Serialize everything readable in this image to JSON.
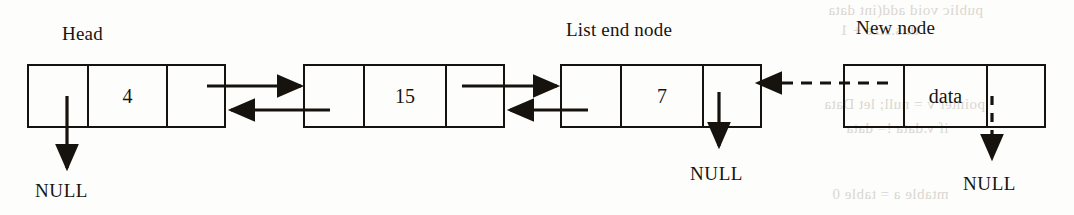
{
  "diagram": {
    "background_color": "#fdfdfb",
    "ink_color": "#16120d",
    "captions": {
      "head": "Head",
      "list_end_node": "List end node",
      "new_node": "New node"
    },
    "null_labels": {
      "head_prev": "NULL",
      "end_next": "NULL",
      "new_next": "NULL"
    },
    "nodes": [
      {
        "name": "head-node",
        "value": "",
        "prev_cell": "",
        "data_cell": "4",
        "next_cell": "",
        "caption": "Head"
      },
      {
        "name": "second-node",
        "value": "",
        "prev_cell": "",
        "data_cell": "15",
        "next_cell": "",
        "caption": ""
      },
      {
        "name": "list-end-node",
        "value": "",
        "prev_cell": "",
        "data_cell": "7",
        "next_cell": "",
        "caption": "List end node"
      },
      {
        "name": "new-node",
        "value": "",
        "prev_cell": "",
        "data_cell": "data",
        "next_cell": "",
        "caption": "New node"
      }
    ],
    "links": [
      {
        "name": "next-link-1",
        "from": "head-node",
        "to": "second-node",
        "direction": "forward",
        "style": "solid"
      },
      {
        "name": "prev-link-1",
        "from": "second-node",
        "to": "head-node",
        "direction": "backward",
        "style": "solid"
      },
      {
        "name": "next-link-2",
        "from": "second-node",
        "to": "list-end-node",
        "direction": "forward",
        "style": "solid"
      },
      {
        "name": "prev-link-2",
        "from": "list-end-node",
        "to": "second-node",
        "direction": "backward",
        "style": "solid"
      },
      {
        "name": "new-prev-link",
        "from": "new-node",
        "to": "list-end-node",
        "direction": "backward",
        "style": "dashed"
      },
      {
        "name": "head-null-link",
        "from": "head-node",
        "to": "NULL",
        "direction": "down",
        "style": "solid"
      },
      {
        "name": "end-null-link",
        "from": "list-end-node",
        "to": "NULL",
        "direction": "down",
        "style": "solid"
      },
      {
        "name": "new-node-null-link",
        "from": "new-node",
        "to": "NULL",
        "direction": "down",
        "style": "dashed"
      }
    ]
  },
  "bleed_text": {
    "line1": "public void add(int data",
    "line2": "this.size + 1",
    "line3": "pointer v = null; let Data",
    "line4": "if v.data != data",
    "line5": "mtable a = table 0"
  }
}
